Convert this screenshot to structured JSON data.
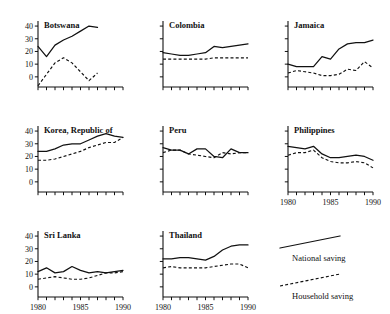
{
  "figure": {
    "type": "small-multiples-line-chart",
    "panel_count": 8,
    "x_axis_label": "",
    "y_axis_label": ""
  },
  "legend": {
    "position": "bottom-right",
    "entries": [
      {
        "label": "National saving",
        "style": "solid"
      },
      {
        "label": "Household saving",
        "style": "dashed"
      }
    ]
  },
  "axis": {
    "x_ticks": [
      1980,
      1981,
      1982,
      1983,
      1984,
      1985,
      1986,
      1987,
      1988,
      1989,
      1990
    ],
    "x_tick_labels": [
      "1980",
      "1985",
      "1990"
    ],
    "x_labeled_values": [
      1980,
      1985,
      1990
    ],
    "y_ticks": [
      0,
      10,
      20,
      30,
      40
    ],
    "y_tick_labels": [
      "0",
      "10",
      "20",
      "30",
      "40"
    ],
    "xlim": [
      1980,
      1990
    ],
    "ylim": [
      -8,
      44
    ],
    "grid": false
  },
  "chart_data": {
    "type": "line",
    "title": "",
    "xlabel": "",
    "ylabel": "",
    "xlim": [
      1980,
      1990
    ],
    "ylim": [
      -8,
      44
    ],
    "x": [
      1980,
      1981,
      1982,
      1983,
      1984,
      1985,
      1986,
      1987,
      1988,
      1989,
      1990
    ],
    "series_names": [
      "National saving",
      "Household saving"
    ],
    "panels": [
      {
        "title": "Botswana",
        "row": 0,
        "col": 0,
        "y_labeled": true,
        "x_labeled": false,
        "series": [
          {
            "name": "National saving",
            "style": "solid",
            "x": [
              1980,
              1981,
              1982,
              1983,
              1984,
              1985,
              1986,
              1987
            ],
            "values": [
              24,
              16,
              25,
              29,
              32,
              36,
              40,
              39
            ]
          },
          {
            "name": "Household saving",
            "style": "dashed",
            "x": [
              1980,
              1981,
              1982,
              1983,
              1984,
              1985,
              1986,
              1987
            ],
            "values": [
              -7,
              2,
              11,
              15,
              11,
              4,
              -3,
              3
            ]
          }
        ]
      },
      {
        "title": "Colombia",
        "row": 0,
        "col": 1,
        "y_labeled": false,
        "x_labeled": false,
        "series": [
          {
            "name": "National saving",
            "style": "solid",
            "x": [
              1980,
              1981,
              1982,
              1983,
              1984,
              1985,
              1986,
              1987,
              1988,
              1989,
              1990
            ],
            "values": [
              19,
              18,
              17,
              17,
              18,
              19,
              24,
              23,
              24,
              25,
              26
            ]
          },
          {
            "name": "Household saving",
            "style": "dashed",
            "x": [
              1980,
              1981,
              1982,
              1983,
              1984,
              1985,
              1986,
              1987,
              1988,
              1989,
              1990
            ],
            "values": [
              14,
              14,
              14,
              14,
              14,
              14,
              15,
              15,
              15,
              15,
              15
            ]
          }
        ]
      },
      {
        "title": "Jamaica",
        "row": 0,
        "col": 2,
        "y_labeled": false,
        "x_labeled": false,
        "series": [
          {
            "name": "National saving",
            "style": "solid",
            "x": [
              1980,
              1981,
              1982,
              1983,
              1984,
              1985,
              1986,
              1987,
              1988,
              1989,
              1990
            ],
            "values": [
              10,
              8,
              8,
              8,
              16,
              14,
              22,
              26,
              27,
              27,
              29
            ]
          },
          {
            "name": "Household saving",
            "style": "dashed",
            "x": [
              1980,
              1981,
              1982,
              1983,
              1984,
              1985,
              1986,
              1987,
              1988,
              1989,
              1990
            ],
            "values": [
              3,
              5,
              4,
              3,
              1,
              1,
              2,
              6,
              5,
              12,
              7
            ]
          }
        ]
      },
      {
        "title": "Korea, Republic of",
        "row": 1,
        "col": 0,
        "y_labeled": true,
        "x_labeled": false,
        "series": [
          {
            "name": "National saving",
            "style": "solid",
            "x": [
              1980,
              1981,
              1982,
              1983,
              1984,
              1985,
              1986,
              1987,
              1988,
              1989,
              1990
            ],
            "values": [
              24,
              24,
              26,
              29,
              30,
              30,
              33,
              36,
              38,
              36,
              35
            ]
          },
          {
            "name": "Household saving",
            "style": "dashed",
            "x": [
              1980,
              1981,
              1982,
              1983,
              1984,
              1985,
              1986,
              1987,
              1988,
              1989,
              1990
            ],
            "values": [
              17,
              17,
              18,
              20,
              22,
              24,
              27,
              29,
              31,
              31,
              35
            ]
          }
        ]
      },
      {
        "title": "Peru",
        "row": 1,
        "col": 1,
        "y_labeled": false,
        "x_labeled": false,
        "series": [
          {
            "name": "National saving",
            "style": "solid",
            "x": [
              1980,
              1981,
              1982,
              1983,
              1984,
              1985,
              1986,
              1987,
              1988,
              1989,
              1990
            ],
            "values": [
              27,
              25,
              25,
              22,
              26,
              26,
              20,
              19,
              26,
              23,
              23
            ]
          },
          {
            "name": "Household saving",
            "style": "dashed",
            "x": [
              1980,
              1981,
              1982,
              1983,
              1984,
              1985,
              1986,
              1987,
              1988,
              1989,
              1990
            ],
            "values": [
              23,
              25,
              25,
              22,
              21,
              20,
              19,
              23,
              22,
              23,
              23
            ]
          }
        ]
      },
      {
        "title": "Philippines",
        "row": 1,
        "col": 2,
        "y_labeled": false,
        "x_labeled": true,
        "series": [
          {
            "name": "National saving",
            "style": "solid",
            "x": [
              1980,
              1981,
              1982,
              1983,
              1984,
              1985,
              1986,
              1987,
              1988,
              1989,
              1990
            ],
            "values": [
              28,
              27,
              26,
              28,
              22,
              19,
              19,
              20,
              21,
              20,
              17
            ]
          },
          {
            "name": "Household saving",
            "style": "dashed",
            "x": [
              1980,
              1981,
              1982,
              1983,
              1984,
              1985,
              1986,
              1987,
              1988,
              1989,
              1990
            ],
            "values": [
              21,
              23,
              23,
              25,
              19,
              16,
              15,
              15,
              16,
              15,
              11
            ]
          }
        ]
      },
      {
        "title": "Sri Lanka",
        "row": 2,
        "col": 0,
        "y_labeled": true,
        "x_labeled": true,
        "series": [
          {
            "name": "National saving",
            "style": "solid",
            "x": [
              1980,
              1981,
              1982,
              1983,
              1984,
              1985,
              1986,
              1987,
              1988,
              1989,
              1990
            ],
            "values": [
              12,
              15,
              11,
              12,
              16,
              13,
              11,
              12,
              11,
              12,
              13
            ]
          },
          {
            "name": "Household saving",
            "style": "dashed",
            "x": [
              1980,
              1981,
              1982,
              1983,
              1984,
              1985,
              1986,
              1987,
              1988,
              1989,
              1990
            ],
            "values": [
              6,
              7,
              8,
              7,
              6,
              6,
              7,
              9,
              11,
              11,
              12
            ]
          }
        ]
      },
      {
        "title": "Thailand",
        "row": 2,
        "col": 1,
        "y_labeled": false,
        "x_labeled": true,
        "series": [
          {
            "name": "National saving",
            "style": "solid",
            "x": [
              1980,
              1981,
              1982,
              1983,
              1984,
              1985,
              1986,
              1987,
              1988,
              1989,
              1990
            ],
            "values": [
              22,
              22,
              23,
              23,
              22,
              21,
              24,
              29,
              32,
              33,
              33
            ]
          },
          {
            "name": "Household saving",
            "style": "dashed",
            "x": [
              1980,
              1981,
              1982,
              1983,
              1984,
              1985,
              1986,
              1987,
              1988,
              1989,
              1990
            ],
            "values": [
              15,
              16,
              15,
              15,
              15,
              15,
              16,
              17,
              18,
              18,
              15
            ]
          }
        ]
      }
    ]
  }
}
